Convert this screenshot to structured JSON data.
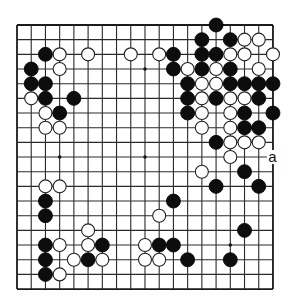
{
  "board": {
    "size": 19,
    "origin_x": 17,
    "origin_y": 25,
    "spacing_x": 14.22,
    "spacing_y": 14.67,
    "stone_radius": 7,
    "colors": {
      "line": "#2a2a2a",
      "black": "#0d0d0d",
      "white": "#ffffff",
      "background": "#ffffff"
    },
    "star_points": [
      [
        3,
        3
      ],
      [
        9,
        3
      ],
      [
        15,
        3
      ],
      [
        3,
        9
      ],
      [
        9,
        9
      ],
      [
        15,
        9
      ],
      [
        3,
        15
      ],
      [
        9,
        15
      ],
      [
        15,
        15
      ]
    ],
    "black_stones": [
      [
        2,
        2
      ],
      [
        1,
        3
      ],
      [
        1,
        4
      ],
      [
        2,
        4
      ],
      [
        2,
        5
      ],
      [
        4,
        5
      ],
      [
        3,
        6
      ],
      [
        14,
        0
      ],
      [
        13,
        1
      ],
      [
        15,
        1
      ],
      [
        11,
        2
      ],
      [
        13,
        2
      ],
      [
        14,
        2
      ],
      [
        11,
        3
      ],
      [
        13,
        3
      ],
      [
        15,
        3
      ],
      [
        12,
        4
      ],
      [
        15,
        4
      ],
      [
        16,
        4
      ],
      [
        17,
        4
      ],
      [
        18,
        4
      ],
      [
        12,
        5
      ],
      [
        14,
        5
      ],
      [
        17,
        5
      ],
      [
        12,
        6
      ],
      [
        16,
        6
      ],
      [
        18,
        6
      ],
      [
        16,
        7
      ],
      [
        17,
        7
      ],
      [
        14,
        8
      ],
      [
        16,
        10
      ],
      [
        14,
        11
      ],
      [
        17,
        11
      ],
      [
        11,
        12
      ],
      [
        16,
        14
      ],
      [
        10,
        15
      ],
      [
        11,
        15
      ],
      [
        12,
        16
      ],
      [
        15,
        16
      ],
      [
        2,
        12
      ],
      [
        2,
        13
      ],
      [
        2,
        15
      ],
      [
        6,
        15
      ],
      [
        2,
        16
      ],
      [
        5,
        16
      ],
      [
        2,
        17
      ]
    ],
    "white_stones": [
      [
        3,
        2
      ],
      [
        5,
        2
      ],
      [
        8,
        2
      ],
      [
        3,
        3
      ],
      [
        1,
        5
      ],
      [
        2,
        6
      ],
      [
        2,
        7
      ],
      [
        3,
        7
      ],
      [
        16,
        1
      ],
      [
        17,
        1
      ],
      [
        10,
        2
      ],
      [
        15,
        2
      ],
      [
        16,
        2
      ],
      [
        18,
        2
      ],
      [
        12,
        3
      ],
      [
        14,
        3
      ],
      [
        17,
        3
      ],
      [
        13,
        4
      ],
      [
        14,
        4
      ],
      [
        13,
        5
      ],
      [
        15,
        5
      ],
      [
        16,
        5
      ],
      [
        13,
        6
      ],
      [
        15,
        6
      ],
      [
        13,
        7
      ],
      [
        15,
        7
      ],
      [
        15,
        8
      ],
      [
        16,
        8
      ],
      [
        17,
        8
      ],
      [
        15,
        9
      ],
      [
        13,
        10
      ],
      [
        10,
        13
      ],
      [
        9,
        15
      ],
      [
        9,
        16
      ],
      [
        10,
        16
      ],
      [
        2,
        11
      ],
      [
        3,
        11
      ],
      [
        5,
        14
      ],
      [
        3,
        15
      ],
      [
        5,
        15
      ],
      [
        4,
        16
      ],
      [
        6,
        16
      ],
      [
        3,
        17
      ]
    ],
    "labels": [
      {
        "text": "a",
        "col": 18,
        "row": 9
      }
    ]
  }
}
